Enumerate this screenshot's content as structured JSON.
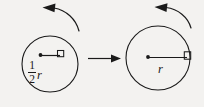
{
  "figure": {
    "title": "",
    "background_color": "#f3f2f0",
    "stroke_color": "#1a1a1a",
    "type": "rotating-disk-comparison-diagram",
    "left_panel": {
      "name": "left-disk",
      "circle": {
        "cx": 50,
        "cy": 64,
        "r": 28
      },
      "center_dot_label": "center-dot",
      "radius_line_label": "radius-line",
      "block_label": "block-square",
      "rotation_arrow_label": "counterclockwise-rotation-arrow",
      "rotation_direction": "counterclockwise",
      "distance_label_numerator": "1",
      "distance_label_denominator": "2",
      "distance_label_variable": "r"
    },
    "transition": {
      "name": "transition-arrow",
      "direction": "right"
    },
    "right_panel": {
      "name": "right-disk",
      "circle": {
        "cx": 158,
        "cy": 58,
        "r": 32
      },
      "center_dot_label": "center-dot",
      "radius_line_label": "radius-line",
      "block_label": "block-square",
      "rotation_arrow_label": "counterclockwise-rotation-arrow",
      "rotation_direction": "counterclockwise",
      "distance_label_variable": "r"
    }
  }
}
